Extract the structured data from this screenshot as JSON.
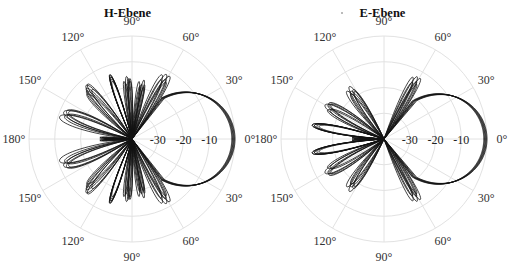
{
  "chart_data": [
    {
      "type": "polar",
      "title": "H-Ebene",
      "center": [
        132,
        139
      ],
      "radius": 103,
      "r_axis": {
        "min_db": -40,
        "max_db": 0,
        "rings_db": [
          -30,
          -20,
          -10,
          0
        ],
        "tick_labels": [
          "-30",
          "-20",
          "-10"
        ]
      },
      "angle_labels": {
        "upper": [
          {
            "angle": 0,
            "label": "0°"
          },
          {
            "angle": 30,
            "label": "30°"
          },
          {
            "angle": 60,
            "label": "60°"
          },
          {
            "angle": 90,
            "label": "90°"
          },
          {
            "angle": 120,
            "label": "120°"
          },
          {
            "angle": 150,
            "label": "150°"
          },
          {
            "angle": 180,
            "label": "180°"
          }
        ],
        "lower": [
          {
            "angle": 30,
            "label": "30°"
          },
          {
            "angle": 60,
            "label": "60°"
          },
          {
            "angle": 90,
            "label": "90°"
          },
          {
            "angle": 120,
            "label": "120°"
          },
          {
            "angle": 150,
            "label": "150°"
          }
        ]
      },
      "grid": true,
      "series_count": 6,
      "main_lobe": {
        "peak_db": 0,
        "half_width_deg": 40,
        "null_deg": 52
      },
      "side_lobes_db": [
        {
          "center_deg": 62,
          "width_deg": 14,
          "peak_db": -13
        },
        {
          "center_deg": 80,
          "width_deg": 10,
          "peak_db": -18
        },
        {
          "center_deg": 95,
          "width_deg": 10,
          "peak_db": -17
        },
        {
          "center_deg": 112,
          "width_deg": 12,
          "peak_db": -15
        },
        {
          "center_deg": 132,
          "width_deg": 16,
          "peak_db": -14
        },
        {
          "center_deg": 160,
          "width_deg": 22,
          "peak_db": -12
        },
        {
          "center_deg": 180,
          "width_deg": 8,
          "peak_db": -28
        }
      ]
    },
    {
      "type": "polar",
      "title": "E-Ebene",
      "center": [
        384,
        139
      ],
      "radius": 103,
      "r_axis": {
        "min_db": -40,
        "max_db": 0,
        "rings_db": [
          -30,
          -20,
          -10,
          0
        ],
        "tick_labels": [
          "-30",
          "-20",
          "-10"
        ]
      },
      "angle_labels": {
        "upper": [
          {
            "angle": 0,
            "label": "0°"
          },
          {
            "angle": 30,
            "label": "30°"
          },
          {
            "angle": 60,
            "label": "60°"
          },
          {
            "angle": 90,
            "label": "90°"
          },
          {
            "angle": 120,
            "label": "120°"
          },
          {
            "angle": 150,
            "label": "150°"
          },
          {
            "angle": 180,
            "label": "180°"
          }
        ],
        "lower": [
          {
            "angle": 30,
            "label": "30°"
          },
          {
            "angle": 60,
            "label": "60°"
          },
          {
            "angle": 90,
            "label": "90°"
          },
          {
            "angle": 120,
            "label": "120°"
          },
          {
            "angle": 150,
            "label": "150°"
          }
        ]
      },
      "grid": true,
      "series_count": 6,
      "main_lobe": {
        "peak_db": 0,
        "half_width_deg": 38,
        "null_deg": 50
      },
      "side_lobes_db": [
        {
          "center_deg": 62,
          "width_deg": 12,
          "peak_db": -14
        },
        {
          "center_deg": 125,
          "width_deg": 18,
          "peak_db": -17
        },
        {
          "center_deg": 150,
          "width_deg": 20,
          "peak_db": -15
        },
        {
          "center_deg": 172,
          "width_deg": 16,
          "peak_db": -13
        },
        {
          "center_deg": 180,
          "width_deg": 6,
          "peak_db": -29
        }
      ]
    }
  ]
}
